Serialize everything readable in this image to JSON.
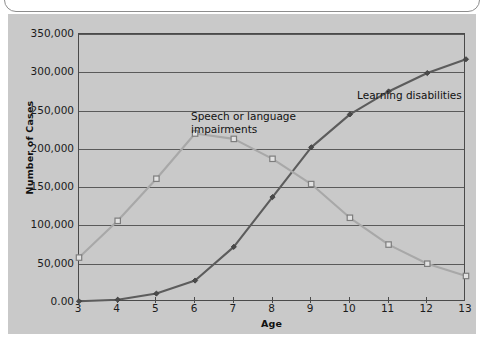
{
  "figure": {
    "panel_background": "#c9c9c9",
    "page_background": "#ffffff"
  },
  "chart_data": {
    "type": "line",
    "title": "",
    "subtitle": "",
    "xlabel": "Age",
    "ylabel": "Number of Cases",
    "x": [
      3,
      4,
      5,
      6,
      7,
      8,
      9,
      10,
      11,
      12,
      13
    ],
    "categories": [
      "3",
      "4",
      "5",
      "6",
      "7",
      "8",
      "9",
      "10",
      "11",
      "12",
      "13"
    ],
    "xlim": [
      3,
      13
    ],
    "ylim": [
      0,
      350000
    ],
    "ytick_labels": [
      "350,000",
      "300,000",
      "250,000",
      "200,000",
      "150,000",
      "100,000",
      "50,000",
      "0.00"
    ],
    "ytick_values": [
      350000,
      300000,
      250000,
      200000,
      150000,
      100000,
      50000,
      0
    ],
    "grid": "horizontal",
    "legend_position": "inline-annotations",
    "series": [
      {
        "name": "Learning disabilities",
        "color": "#5c5c5c",
        "marker": "filled-diamond",
        "values": [
          1000,
          3000,
          11000,
          28000,
          72000,
          137000,
          202000,
          245000,
          275000,
          299000,
          317000
        ]
      },
      {
        "name": "Speech or language impairments",
        "color": "#a8a8a8",
        "marker": "open-square",
        "values": [
          58000,
          106000,
          161000,
          220000,
          213000,
          187000,
          154000,
          110000,
          75000,
          50000,
          34000
        ]
      }
    ],
    "annotations": [
      {
        "text": "Speech or language\nimpairments",
        "x": 5.0,
        "y": 243000
      },
      {
        "text": "Learning disabilities",
        "x": 9.4,
        "y": 290000
      }
    ]
  }
}
